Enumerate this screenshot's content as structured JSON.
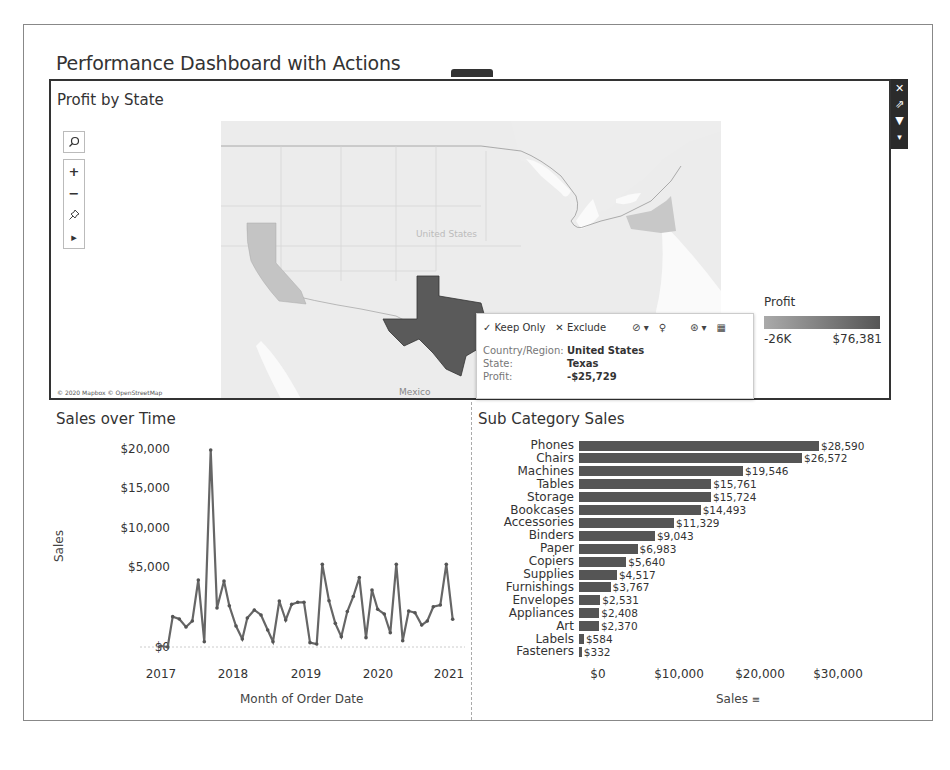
{
  "dashboard": {
    "title": "Performance Dashboard with Actions"
  },
  "side_toolbar": {
    "icons": [
      "close-icon",
      "goto-sheet-icon",
      "filter-icon",
      "more-options-icon"
    ],
    "glyphs": [
      "✕",
      "⇗",
      "▼",
      "▾"
    ]
  },
  "map": {
    "title": "Profit by State",
    "tools": {
      "search": "⌕",
      "zoom_in": "+",
      "zoom_out": "−",
      "pin": "✧",
      "expand": "▸"
    },
    "attribution": "© 2020 Mapbox © OpenStreetMap",
    "label_mexico": "Mexico",
    "label_us": "United States",
    "colors": {
      "background": "#ebebeb",
      "texas": "#5a5a5a",
      "california": "#c4c4c4",
      "new_york": "#c8c8c8",
      "water": "#ffffff"
    }
  },
  "tooltip": {
    "keep_only": "✓ Keep Only",
    "exclude": "✕ Exclude",
    "group_icon": "⊘ ▾",
    "pin_icon": "♀",
    "set_icon": "⊛ ▾",
    "view_data_icon": "▦",
    "rows": [
      {
        "label": "Country/Region:",
        "value": "United States"
      },
      {
        "label": "State:",
        "value": "Texas"
      },
      {
        "label": "Profit:",
        "value": "-$25,729"
      }
    ]
  },
  "legend": {
    "title": "Profit",
    "min_label": "-26K",
    "max_label": "$76,381"
  },
  "sales_over_time": {
    "title": "Sales over Time",
    "ylabel": "Sales",
    "xlabel": "Month of Order Date",
    "yticks": [
      "$20,000",
      "$15,000",
      "$10,000",
      "$5,000",
      "$0"
    ],
    "xticks": [
      "2017",
      "2018",
      "2019",
      "2020",
      "2021"
    ]
  },
  "sub_category_sales": {
    "title": "Sub Category Sales",
    "xlabel": "Sales",
    "sort_icon": "≡",
    "xticks": [
      "$0",
      "$10,000",
      "$20,000",
      "$30,000"
    ]
  },
  "chart_data": [
    {
      "type": "line",
      "title": "Sales over Time",
      "xlabel": "Month of Order Date",
      "ylabel": "Sales",
      "ylim": [
        0,
        20000
      ],
      "x_ticks": [
        "2017",
        "2018",
        "2019",
        "2020",
        "2021"
      ],
      "grid": false,
      "series": [
        {
          "name": "Sales",
          "x_px": [
            160.7,
            167.7,
            172.7,
            179.3,
            186,
            192.3,
            198.3,
            204.3,
            210.7,
            217,
            224,
            229.3,
            236,
            242.3,
            247.3,
            254.3,
            261,
            267.7,
            273,
            279.3,
            285.7,
            291.7,
            297.7,
            304,
            310,
            316.7,
            322.3,
            329,
            335.3,
            341.3,
            347.3,
            353.3,
            359.3,
            366,
            372,
            377.7,
            384.3,
            390.3,
            396.3,
            402.7,
            408.7,
            415,
            421.7,
            427.3,
            433.3,
            440.3,
            446.3,
            452.7
          ],
          "values": [
            100,
            0,
            3080,
            2840,
            2030,
            2640,
            6800,
            540,
            20000,
            3960,
            6700,
            4190,
            2130,
            810,
            2940,
            3760,
            3250,
            1730,
            540,
            4670,
            2740,
            4330,
            4540,
            4540,
            440,
            300,
            8390,
            4700,
            2400,
            1050,
            3600,
            5130,
            7050,
            950,
            5790,
            3830,
            3350,
            1450,
            8390,
            640,
            3650,
            3480,
            2230,
            2640,
            4090,
            4260,
            8390,
            2810
          ]
        }
      ]
    },
    {
      "type": "bar",
      "orientation": "horizontal",
      "title": "Sub Category Sales",
      "xlabel": "Sales",
      "xlim": [
        0,
        30000
      ],
      "x_ticks": [
        "$0",
        "$10,000",
        "$20,000",
        "$30,000"
      ],
      "categories": [
        "Phones",
        "Chairs",
        "Machines",
        "Tables",
        "Storage",
        "Bookcases",
        "Accessories",
        "Binders",
        "Paper",
        "Copiers",
        "Supplies",
        "Furnishings",
        "Envelopes",
        "Appliances",
        "Art",
        "Labels",
        "Fasteners"
      ],
      "values": [
        28590,
        26572,
        19546,
        15761,
        15724,
        14493,
        11329,
        9043,
        6983,
        5640,
        4517,
        3767,
        2531,
        2408,
        2370,
        584,
        332
      ],
      "labels": [
        "$28,590",
        "$26,572",
        "$19,546",
        "$15,761",
        "$15,724",
        "$14,493",
        "$11,329",
        "$9,043",
        "$6,983",
        "$5,640",
        "$4,517",
        "$3,767",
        "$2,531",
        "$2,408",
        "$2,370",
        "$584",
        "$332"
      ]
    }
  ]
}
